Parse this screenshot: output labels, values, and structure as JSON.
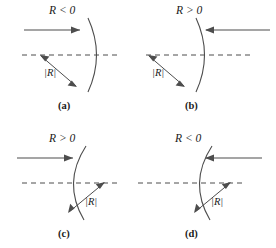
{
  "figure": {
    "type": "optics-sign-convention-diagram",
    "panel_count": 4,
    "stroke_color": "#4d4d4d",
    "text_color": "#1a1a1a",
    "panels": [
      {
        "id": "a",
        "panel_label": "(a)",
        "sign_label": "R < 0",
        "sign_label_R": "R",
        "sign_label_op": "<",
        "sign_label_value": "0",
        "radius_label": "|R|",
        "ray_direction": "left-to-right",
        "surface_bulge": "right",
        "center_of_curvature_side": "left"
      },
      {
        "id": "b",
        "panel_label": "(b)",
        "sign_label": "R > 0",
        "sign_label_R": "R",
        "sign_label_op": ">",
        "sign_label_value": "0",
        "radius_label": "|R|",
        "ray_direction": "right-to-left",
        "surface_bulge": "right",
        "center_of_curvature_side": "left"
      },
      {
        "id": "c",
        "panel_label": "(c)",
        "sign_label": "R > 0",
        "sign_label_R": "R",
        "sign_label_op": ">",
        "sign_label_value": "0",
        "radius_label": "|R|",
        "ray_direction": "left-to-right",
        "surface_bulge": "left",
        "center_of_curvature_side": "right"
      },
      {
        "id": "d",
        "panel_label": "(d)",
        "sign_label": "R < 0",
        "sign_label_R": "R",
        "sign_label_op": "<",
        "sign_label_value": "0",
        "radius_label": "|R|",
        "ray_direction": "right-to-left",
        "surface_bulge": "left",
        "center_of_curvature_side": "right"
      }
    ]
  }
}
